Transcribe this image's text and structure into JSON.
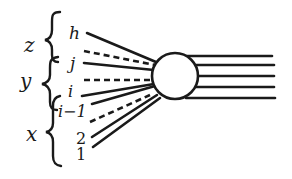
{
  "diagram": {
    "colors": {
      "ink": "#1a1a1a",
      "background": "#ffffff"
    },
    "groups": [
      {
        "name": "z",
        "label": "z",
        "members": [
          "h"
        ]
      },
      {
        "name": "y",
        "label": "y",
        "members": [
          "j",
          "i"
        ]
      },
      {
        "name": "x",
        "label": "x",
        "members": [
          "i−1",
          "2",
          "1"
        ]
      }
    ],
    "line_labels": {
      "h": "h",
      "j": "j",
      "i": "i",
      "i_minus_1": "i−1",
      "two": "2",
      "one": "1"
    },
    "incoming_lines": [
      {
        "label": "h",
        "style": "solid"
      },
      {
        "label": "",
        "style": "dashed"
      },
      {
        "label": "j",
        "style": "solid"
      },
      {
        "label": "",
        "style": "dashed"
      },
      {
        "label": "i",
        "style": "solid"
      },
      {
        "label": "i−1",
        "style": "solid"
      },
      {
        "label": "",
        "style": "dashed"
      },
      {
        "label": "2",
        "style": "solid"
      },
      {
        "label": "1",
        "style": "solid"
      }
    ],
    "vertex": {
      "shape": "circle"
    },
    "outgoing_lines": {
      "count": 5,
      "style": "solid"
    }
  }
}
